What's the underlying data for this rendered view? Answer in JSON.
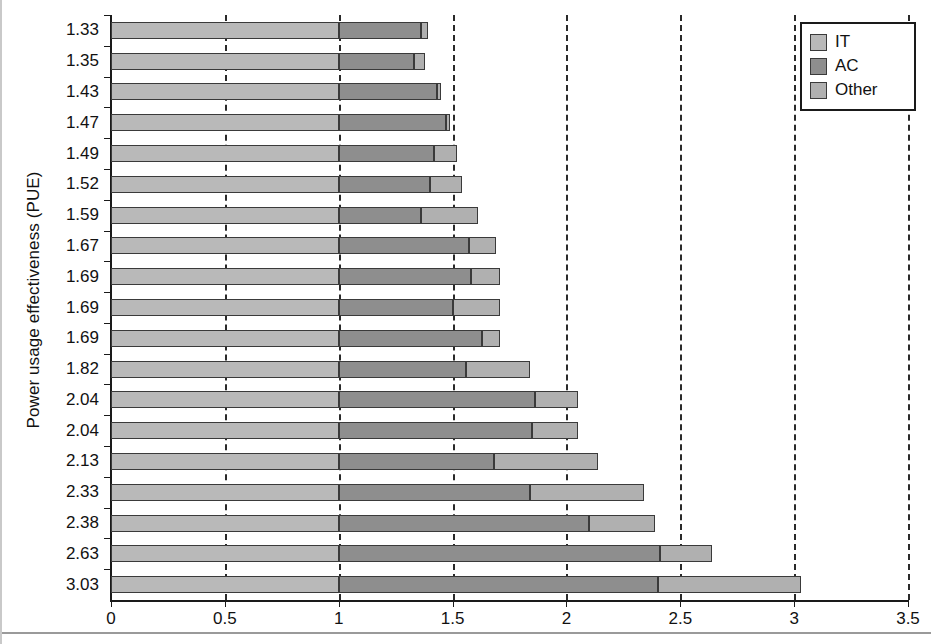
{
  "chart_data": {
    "type": "bar",
    "orientation": "horizontal",
    "stacked": true,
    "title": "",
    "xlabel": "",
    "ylabel": "Power usage effectiveness (PUE)",
    "xlim": [
      0,
      3.5
    ],
    "xticks": [
      "0",
      "0.5",
      "1",
      "1.5",
      "2",
      "2.5",
      "3",
      "3.5"
    ],
    "xtick_values": [
      0,
      0.5,
      1,
      1.5,
      2,
      2.5,
      3,
      3.5
    ],
    "grid": "vertical dashed gridlines at every 0.5",
    "legend_position": "top-right",
    "categories": [
      "1.33",
      "1.35",
      "1.43",
      "1.47",
      "1.49",
      "1.52",
      "1.59",
      "1.67",
      "1.69",
      "1.69",
      "1.69",
      "1.82",
      "2.04",
      "2.04",
      "2.13",
      "2.33",
      "2.38",
      "2.63",
      "3.03"
    ],
    "series": [
      {
        "name": "IT",
        "color": "#b9b9b9",
        "values": [
          1.0,
          1.0,
          1.0,
          1.0,
          1.0,
          1.0,
          1.0,
          1.0,
          1.0,
          1.0,
          1.0,
          1.0,
          1.0,
          1.0,
          1.0,
          1.0,
          1.0,
          1.0,
          1.0
        ]
      },
      {
        "name": "AC",
        "color": "#8e8e8e",
        "values": [
          0.36,
          0.33,
          0.43,
          0.47,
          0.42,
          0.4,
          0.36,
          0.57,
          0.58,
          0.5,
          0.63,
          0.56,
          0.86,
          0.85,
          0.68,
          0.84,
          1.1,
          1.41,
          1.4
        ]
      },
      {
        "name": "Other",
        "color": "#b0b0b0",
        "values": [
          0.03,
          0.05,
          0.02,
          0.02,
          0.1,
          0.14,
          0.25,
          0.12,
          0.13,
          0.21,
          0.08,
          0.28,
          0.19,
          0.2,
          0.46,
          0.5,
          0.29,
          0.23,
          0.63
        ]
      }
    ],
    "totals": [
      1.39,
      1.38,
      1.45,
      1.49,
      1.52,
      1.54,
      1.61,
      1.69,
      1.71,
      1.71,
      1.71,
      1.84,
      2.05,
      2.05,
      2.14,
      2.34,
      2.39,
      2.64,
      3.03
    ]
  },
  "legend": {
    "items": [
      {
        "label": "IT",
        "color": "#b9b9b9"
      },
      {
        "label": "AC",
        "color": "#8e8e8e"
      },
      {
        "label": "Other",
        "color": "#b0b0b0"
      }
    ]
  }
}
